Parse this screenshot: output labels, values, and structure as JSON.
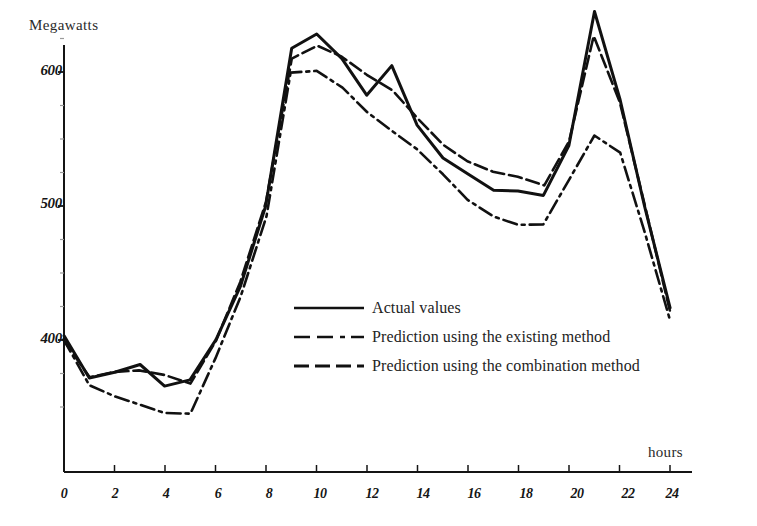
{
  "figure": {
    "clipped_header_text": "",
    "y_axis_title": "Megawatts",
    "x_axis_title": "hours"
  },
  "axes": {
    "y_ticks": [
      "600",
      "500",
      "400"
    ],
    "x_ticks": [
      "0",
      "2",
      "4",
      "6",
      "8",
      "10",
      "12",
      "14",
      "16",
      "18",
      "20",
      "22",
      "24"
    ]
  },
  "legend": {
    "items": [
      {
        "label": "Actual values",
        "style": "solid"
      },
      {
        "label": "Prediction using the existing method",
        "style": "dash-dot"
      },
      {
        "label": "Prediction using the combination method",
        "style": "dashed"
      }
    ]
  },
  "chart_data": {
    "type": "line",
    "title": "",
    "xlabel": "hours",
    "ylabel": "Megawatts",
    "xlim": [
      0,
      24
    ],
    "ylim": [
      330,
      660
    ],
    "grid": false,
    "legend_position": "center",
    "x": [
      0,
      1,
      2,
      3,
      4,
      5,
      6,
      7,
      8,
      9,
      10,
      11,
      12,
      13,
      14,
      15,
      16,
      17,
      18,
      19,
      20,
      21,
      22,
      23,
      24
    ],
    "series": [
      {
        "name": "Actual values",
        "style": "solid",
        "color": "#111111",
        "values": [
          403,
          372,
          376,
          382,
          366,
          370,
          400,
          440,
          500,
          618,
          628,
          610,
          583,
          605,
          560,
          536,
          524,
          512,
          511,
          508,
          545,
          645,
          580,
          500,
          424
        ]
      },
      {
        "name": "Prediction using the existing method",
        "style": "dash-dot",
        "color": "#111111",
        "values": [
          401,
          366,
          358,
          352,
          345,
          345,
          386,
          432,
          492,
          600,
          601,
          588,
          570,
          556,
          542,
          523,
          505,
          492,
          486,
          486,
          520,
          552,
          540,
          480,
          413
        ]
      },
      {
        "name": "Prediction using the combination method",
        "style": "dashed",
        "color": "#111111",
        "values": [
          400,
          372,
          376,
          378,
          374,
          368,
          400,
          443,
          503,
          610,
          620,
          612,
          598,
          586,
          566,
          546,
          533,
          525,
          522,
          515,
          548,
          627,
          578,
          498,
          420
        ]
      }
    ]
  }
}
